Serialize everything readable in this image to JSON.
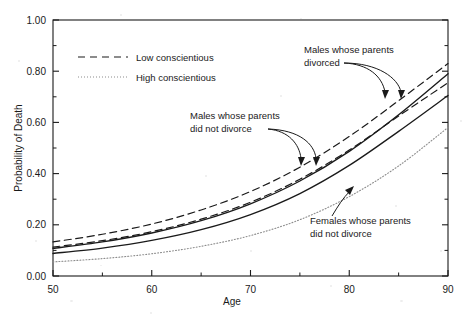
{
  "chart_data": {
    "type": "line",
    "title": "",
    "xlabel": "Age",
    "ylabel": "Probability of Death",
    "xlim": [
      50,
      90
    ],
    "ylim": [
      0.0,
      1.0
    ],
    "xticks": [
      50,
      60,
      70,
      80,
      90
    ],
    "xtick_labels": [
      "50",
      "60",
      "70",
      "80",
      "90"
    ],
    "xminor_ticks": [
      55,
      65,
      75,
      85
    ],
    "yticks": [
      0.0,
      0.2,
      0.4,
      0.6,
      0.8,
      1.0
    ],
    "ytick_labels": [
      "0.00",
      "0.20",
      "0.40",
      "0.60",
      "0.80",
      "1.00"
    ],
    "yminor_ticks": [
      0.1,
      0.3,
      0.5,
      0.7,
      0.9
    ],
    "grid": false,
    "legend_position": "upper-left-inside",
    "legend": [
      {
        "label": "Low conscientious",
        "style": "dashed"
      },
      {
        "label": "High conscientious",
        "style": "dotted"
      }
    ],
    "x": [
      50,
      55,
      60,
      65,
      70,
      75,
      80,
      85,
      90
    ],
    "series": [
      {
        "name": "Males whose parents divorced - low conscientious",
        "style": "dashed",
        "values": [
          0.133,
          0.163,
          0.203,
          0.258,
          0.33,
          0.425,
          0.545,
          0.685,
          0.83
        ]
      },
      {
        "name": "Males whose parents divorced - high conscientious",
        "style": "solid",
        "values": [
          0.108,
          0.133,
          0.168,
          0.216,
          0.282,
          0.371,
          0.487,
          0.63,
          0.79
        ]
      },
      {
        "name": "Males whose parents did not divorce - low conscientious",
        "style": "dashed",
        "values": [
          0.113,
          0.138,
          0.173,
          0.222,
          0.288,
          0.378,
          0.492,
          0.625,
          0.755
        ]
      },
      {
        "name": "Males whose parents did not divorce - high conscientious",
        "style": "solid",
        "values": [
          0.088,
          0.109,
          0.139,
          0.181,
          0.24,
          0.322,
          0.432,
          0.565,
          0.705
        ]
      },
      {
        "name": "Females whose parents did not divorce",
        "style": "dotted",
        "values": [
          0.055,
          0.068,
          0.087,
          0.116,
          0.158,
          0.22,
          0.31,
          0.43,
          0.58
        ]
      }
    ],
    "annotations": [
      {
        "id": "males-divorced",
        "text_line1": "Males whose parents",
        "text_line2": "divorced",
        "x": 304,
        "y": 53
      },
      {
        "id": "males-not-divorced",
        "text_line1": "Males whose parents",
        "text_line2": "did not divorce",
        "x": 190,
        "y": 119
      },
      {
        "id": "females-not-divorced",
        "text_line1": "Females whose parents",
        "text_line2": "did not divorce",
        "x": 310,
        "y": 224
      }
    ],
    "colors": {
      "axis": "#1a1a1a",
      "line": "#1a1a1a",
      "dotted_line": "#8c8c8c",
      "background": "#ffffff"
    }
  }
}
